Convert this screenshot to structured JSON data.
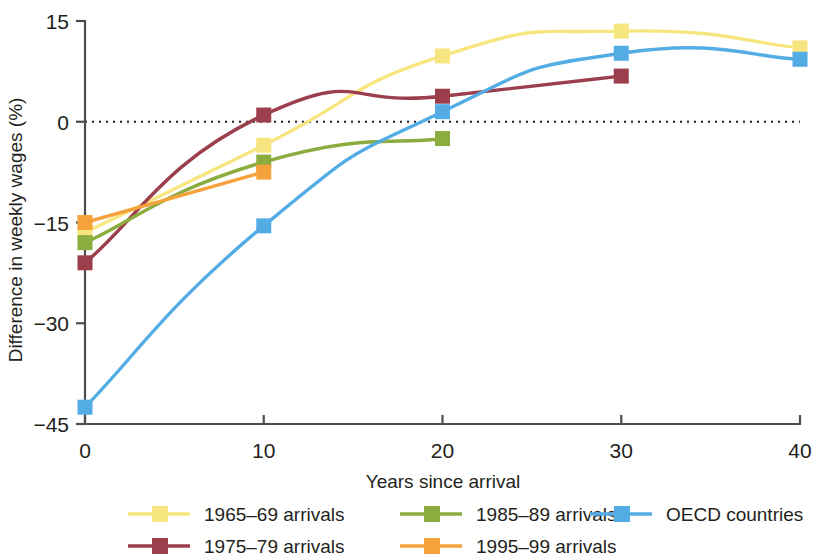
{
  "chart_data": {
    "type": "line",
    "title": "",
    "xlabel": "Years since arrival",
    "ylabel": "Difference in weekly wages (%)",
    "xlim": [
      0,
      40
    ],
    "ylim": [
      -45,
      15
    ],
    "xticks": [
      0,
      10,
      20,
      30,
      40
    ],
    "yticks": [
      15,
      0,
      -15,
      -30,
      -45
    ],
    "xtick_labels": [
      "0",
      "10",
      "20",
      "30",
      "40"
    ],
    "ytick_labels": [
      "15",
      "0",
      "−15",
      "−30",
      "−45"
    ],
    "grid": false,
    "zero_reference_line": true,
    "legend_position": "bottom",
    "legend_columns": 3,
    "x": [
      0,
      10,
      20,
      30,
      40
    ],
    "series": [
      {
        "name": "1965–69 arrivals",
        "color": "#f7e67f",
        "x": [
          0,
          10,
          20,
          30,
          40
        ],
        "values": [
          -16.5,
          -3.5,
          9.8,
          13.5,
          11.0
        ]
      },
      {
        "name": "1975–79 arrivals",
        "color": "#9c3f4d",
        "x": [
          0,
          10,
          20,
          30
        ],
        "values": [
          -21.0,
          1.0,
          3.8,
          6.8
        ]
      },
      {
        "name": "1985–89 arrivals",
        "color": "#8bad3f",
        "x": [
          0,
          10,
          20
        ],
        "values": [
          -18.0,
          -6.0,
          -2.5
        ]
      },
      {
        "name": "1995–99 arrivals",
        "color": "#f6a23c",
        "x": [
          0,
          10
        ],
        "values": [
          -15.0,
          -7.5
        ]
      },
      {
        "name": "OECD countries",
        "color": "#53ace4",
        "x": [
          0,
          10,
          20,
          30,
          40
        ],
        "values": [
          -42.5,
          -15.5,
          1.5,
          10.2,
          9.3
        ]
      }
    ]
  },
  "legend": {
    "entries": [
      {
        "label": "1965–69 arrivals",
        "color": "#f7e67f"
      },
      {
        "label": "1985–89 arrivals",
        "color": "#8bad3f"
      },
      {
        "label": "OECD countries",
        "color": "#53ace4"
      },
      {
        "label": "1975–79 arrivals",
        "color": "#9c3f4d"
      },
      {
        "label": "1995–99 arrivals",
        "color": "#f6a23c"
      }
    ]
  },
  "colors": {
    "axis": "#4d4d4d",
    "text": "#231f20",
    "background": "#ffffff"
  }
}
